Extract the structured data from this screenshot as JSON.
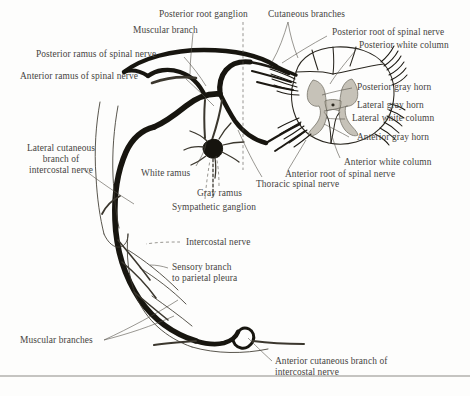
{
  "figure": {
    "type": "anatomical-diagram",
    "ink_color": "#17150f",
    "label_color": "#46443f",
    "background": "#fdfdfc"
  },
  "labels": {
    "posterior_root_ganglion": "Posterior root ganglion",
    "cutaneous_branches": "Cutaneous branches",
    "posterior_root_of_spinal_nerve": "Posterior root of spinal nerve",
    "posterior_white_column": "Posterior white column",
    "muscular_branch": "Muscular branch",
    "posterior_ramus_of_spinal_nerve": "Posterior ramus of spinal nerve",
    "anterior_ramus_of_spinal_nerve": "Anterior ramus of spinal nerve",
    "posterior_gray_horn": "Posterior gray horn",
    "lateral_gray_horn": "Lateral gray horn",
    "lateral_white_column": "Lateral white column",
    "anterior_gray_horn": "Anterior gray horn",
    "anterior_white_column": "Anterior white column",
    "anterior_root_of_spinal_nerve": "Anterior root of spinal nerve",
    "lateral_cutaneous_branch_l1": "Lateral cutaneous",
    "lateral_cutaneous_branch_l2": "branch of",
    "lateral_cutaneous_branch_l3": "intercostal nerve",
    "white_ramus": "White ramus",
    "gray_ramus": "Gray ramus",
    "thoracic_spinal_nerve": "Thoracic spinal nerve",
    "sympathetic_ganglion": "Sympathetic ganglion",
    "intercostal_nerve": "Intercostal nerve",
    "sensory_branch_l1": "Sensory branch",
    "sensory_branch_l2": "to parietal pleura",
    "muscular_branches": "Muscular branches",
    "anterior_cutaneous_l1": "Anterior cutaneous branch of",
    "anterior_cutaneous_l2": "intercostal nerve"
  }
}
